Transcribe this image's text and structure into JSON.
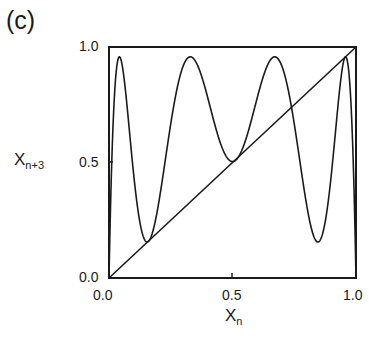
{
  "panel_label": "(c)",
  "axes": {
    "ylabel_main": "X",
    "ylabel_sub": "n+3",
    "xlabel_main": "X",
    "xlabel_sub": "n",
    "yticks": [
      "1.0",
      "0.5",
      "0.0"
    ],
    "xticks": [
      "0.0",
      "0.5",
      "1.0"
    ]
  },
  "chart_data": {
    "type": "line",
    "title": "(c)",
    "xlabel": "X_n",
    "ylabel": "X_{n+3}",
    "xlim": [
      0,
      1
    ],
    "ylim": [
      0,
      1
    ],
    "grid": false,
    "legend": null,
    "series": [
      {
        "name": "third iterate f^3(x), f(x)=r x (1-x)",
        "r": 3.83,
        "description": "Eight-extremum curve with maxima near x=0.05, 0.33, 0.67, 0.97 (y~0.96) and minima near x=0.15, 0.5, 0.85",
        "x": [
          0.0,
          0.05,
          0.15,
          0.33,
          0.5,
          0.67,
          0.85,
          0.97,
          1.0
        ],
        "y": [
          0.0,
          0.96,
          0.15,
          0.96,
          0.49,
          0.96,
          0.15,
          0.96,
          0.0
        ]
      },
      {
        "name": "identity line y = x",
        "x": [
          0.0,
          1.0
        ],
        "y": [
          0.0,
          1.0
        ]
      }
    ]
  },
  "colors": {
    "ink": "#1a1a1a",
    "background": "#ffffff"
  }
}
